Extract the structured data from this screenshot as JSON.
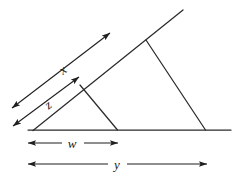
{
  "figure": {
    "background_color": "#ffffff",
    "stroke_color": "#2b2b2b",
    "label_color": "#1a1a1a",
    "labels": {
      "x": "x",
      "z": "z",
      "w": "w",
      "y": "y"
    },
    "label_positions": {
      "x": {
        "cx": 63,
        "cy": 70
      },
      "z": {
        "cx": 48,
        "cy": 105
      },
      "w": {
        "cx": 72,
        "cy": 147
      },
      "y": {
        "cx": 117,
        "cy": 168
      }
    },
    "geometry": {
      "baseline": {
        "x1": 28,
        "y1": 130,
        "x2": 231,
        "y2": 130
      },
      "long_ray": {
        "x1": 33,
        "y1": 130,
        "x2": 183,
        "y2": 10
      },
      "large_triangle_right_side": {
        "x1": 146,
        "y1": 40,
        "x2": 205,
        "y2": 130
      },
      "small_triangle_right_side": {
        "x1": 80,
        "y1": 85,
        "x2": 117,
        "y2": 130
      },
      "large_triangle_vertices": [
        [
          33,
          130
        ],
        [
          146,
          40
        ],
        [
          205,
          130
        ]
      ],
      "small_triangle_vertices": [
        [
          33,
          130
        ],
        [
          80,
          85
        ],
        [
          117,
          130
        ]
      ]
    },
    "dimension_arrows": [
      {
        "name": "x-dimension",
        "label": "x",
        "orientation": "diagonal",
        "double_headed": true,
        "x1": 12,
        "y1": 108,
        "x2": 110,
        "y2": 33
      },
      {
        "name": "z-dimension",
        "label": "z",
        "orientation": "diagonal",
        "double_headed": true,
        "x1": 13,
        "y1": 126,
        "x2": 79,
        "y2": 77
      },
      {
        "name": "w-dimension",
        "label": "w",
        "orientation": "horizontal",
        "double_headed": true,
        "x1": 28,
        "y1": 143,
        "x2": 118,
        "y2": 143
      },
      {
        "name": "y-dimension",
        "label": "y",
        "orientation": "horizontal",
        "double_headed": true,
        "x1": 28,
        "y1": 164,
        "x2": 207,
        "y2": 164
      }
    ]
  }
}
